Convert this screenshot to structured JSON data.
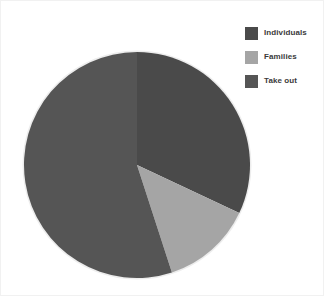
{
  "chart_data": {
    "type": "pie",
    "title": "",
    "categories": [
      "Individuals",
      "Families",
      "Take out"
    ],
    "values": [
      32,
      13,
      55
    ],
    "unit": "percent",
    "colors": [
      "#4a4a4a",
      "#a5a5a5",
      "#555555"
    ],
    "start_angle_deg": 0,
    "direction": "clockwise",
    "slices": [
      {
        "label": "Individuals",
        "value": 32,
        "color": "#4a4a4a",
        "start_deg": 0,
        "end_deg": 115.2
      },
      {
        "label": "Families",
        "value": 13,
        "color": "#a5a5a5",
        "start_deg": 115.2,
        "end_deg": 162.0
      },
      {
        "label": "Take out",
        "value": 55,
        "color": "#555555",
        "start_deg": 162.0,
        "end_deg": 360.0
      }
    ],
    "legend_position": "right",
    "show_labels": false,
    "grid": false
  },
  "legend": {
    "items": [
      {
        "label": "Individuals",
        "color": "#4a4a4a",
        "swatch_name": "legend-swatch-individuals"
      },
      {
        "label": "Families",
        "color": "#a5a5a5",
        "swatch_name": "legend-swatch-families"
      },
      {
        "label": "Take out",
        "color": "#555555",
        "swatch_name": "legend-swatch-take-out"
      }
    ]
  },
  "pie_geometry": {
    "center_x": 115,
    "center_y": 115,
    "radius": 113,
    "edge_color": "#e8e8e8"
  }
}
